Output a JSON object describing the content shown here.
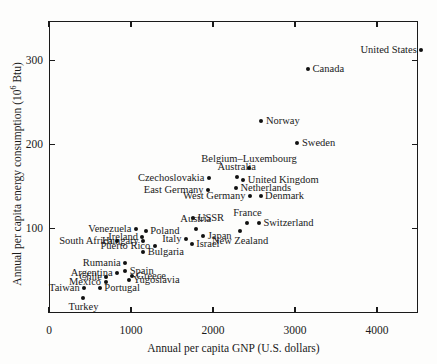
{
  "chart_data": {
    "type": "scatter",
    "title": "",
    "xlabel": "Annual per capita GNP (U.S. dollars)",
    "ylabel_prefix": "Annual per capita energy consumption (10",
    "ylabel_sup": "6",
    "ylabel_suffix": " Btu)",
    "xlim": [
      0,
      4500
    ],
    "ylim": [
      0,
      347
    ],
    "grid": false,
    "legend": false,
    "xticks": [
      0,
      1000,
      2000,
      3000,
      4000
    ],
    "xticklabels": [
      "0",
      "1000",
      "2000",
      "3000",
      "4000"
    ],
    "yticks": [
      100,
      200,
      300
    ],
    "yticklabels": [
      "100",
      "200",
      "300"
    ],
    "point_color": "#111111",
    "axis_color": "#1a1a1a",
    "background": "#fdfdfc",
    "points": [
      {
        "name": "United States",
        "x": 4540,
        "y": 313,
        "label_pos": "left"
      },
      {
        "name": "Canada",
        "x": 3160,
        "y": 290,
        "label_pos": "right"
      },
      {
        "name": "Norway",
        "x": 2590,
        "y": 228,
        "label_pos": "right"
      },
      {
        "name": "Sweden",
        "x": 3030,
        "y": 202,
        "label_pos": "right"
      },
      {
        "name": "Belgium–Luxembourg",
        "x": 2440,
        "y": 172,
        "label_pos": "above"
      },
      {
        "name": "Australia",
        "x": 2290,
        "y": 162,
        "label_pos": "above"
      },
      {
        "name": "United Kingdom",
        "x": 2370,
        "y": 158,
        "label_pos": "right"
      },
      {
        "name": "Netherlands",
        "x": 2280,
        "y": 148,
        "label_pos": "right"
      },
      {
        "name": "West Germany",
        "x": 2450,
        "y": 139,
        "label_pos": "left"
      },
      {
        "name": "Denmark",
        "x": 2580,
        "y": 139,
        "label_pos": "right"
      },
      {
        "name": "Czechoslovakia",
        "x": 1950,
        "y": 160,
        "label_pos": "left"
      },
      {
        "name": "East Germany",
        "x": 1940,
        "y": 146,
        "label_pos": "left"
      },
      {
        "name": "USSR",
        "x": 1760,
        "y": 113,
        "label_pos": "right"
      },
      {
        "name": "France",
        "x": 2420,
        "y": 107,
        "label_pos": "above"
      },
      {
        "name": "Switzerland",
        "x": 2560,
        "y": 107,
        "label_pos": "right"
      },
      {
        "name": "New Zealand",
        "x": 2330,
        "y": 97,
        "label_pos": "below"
      },
      {
        "name": "Austria",
        "x": 1790,
        "y": 100,
        "label_pos": "above"
      },
      {
        "name": "Japan",
        "x": 1880,
        "y": 92,
        "label_pos": "right"
      },
      {
        "name": "Israel",
        "x": 1740,
        "y": 82,
        "label_pos": "right"
      },
      {
        "name": "Italy",
        "x": 1670,
        "y": 88,
        "label_pos": "left"
      },
      {
        "name": "Venezuela",
        "x": 1060,
        "y": 100,
        "label_pos": "left"
      },
      {
        "name": "Poland",
        "x": 1180,
        "y": 97,
        "label_pos": "right"
      },
      {
        "name": "Ireland",
        "x": 1140,
        "y": 90,
        "label_pos": "left"
      },
      {
        "name": "Hungary",
        "x": 1150,
        "y": 85,
        "label_pos": "left"
      },
      {
        "name": "South Africa",
        "x": 830,
        "y": 85,
        "label_pos": "left"
      },
      {
        "name": "Puerto Rico",
        "x": 1290,
        "y": 80,
        "label_pos": "left"
      },
      {
        "name": "Bulgaria",
        "x": 1150,
        "y": 72,
        "label_pos": "right"
      },
      {
        "name": "Rumania",
        "x": 930,
        "y": 60,
        "label_pos": "left"
      },
      {
        "name": "Spain",
        "x": 930,
        "y": 50,
        "label_pos": "right"
      },
      {
        "name": "Argentina",
        "x": 830,
        "y": 48,
        "label_pos": "left"
      },
      {
        "name": "Greece",
        "x": 1010,
        "y": 44,
        "label_pos": "right"
      },
      {
        "name": "Chile",
        "x": 700,
        "y": 43,
        "label_pos": "left"
      },
      {
        "name": "Yugoslavia",
        "x": 970,
        "y": 39,
        "label_pos": "right"
      },
      {
        "name": "Mexico",
        "x": 690,
        "y": 37,
        "label_pos": "left"
      },
      {
        "name": "Portugal",
        "x": 620,
        "y": 30,
        "label_pos": "right"
      },
      {
        "name": "Taiwan",
        "x": 430,
        "y": 30,
        "label_pos": "left"
      },
      {
        "name": "Turkey",
        "x": 420,
        "y": 18,
        "label_pos": "below"
      }
    ]
  }
}
